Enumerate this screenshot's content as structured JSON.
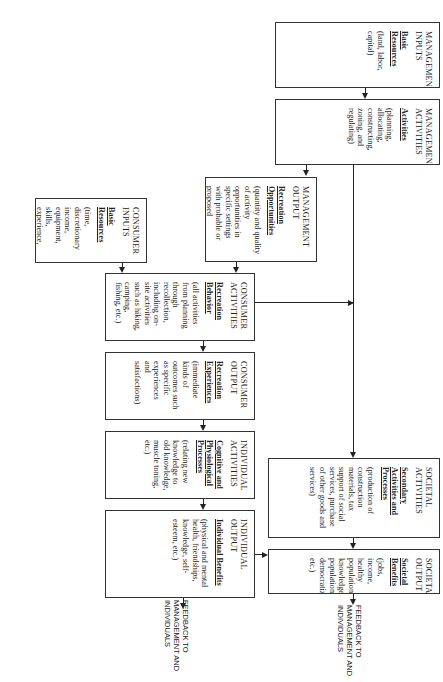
{
  "diagram": {
    "orientation": "rotated 90 degrees clockwise",
    "boxes": {
      "management_inputs": {
        "title": "MANAGEMENT INPUTS",
        "subtitle": "Basic Resources",
        "description": "(land, labor, capital)"
      },
      "management_activities": {
        "title": "MANAGEMENT ACTIVITIES",
        "subtitle": "Activities",
        "description": "(planning, allocating, constructing, zoning, and regulating)"
      },
      "management_output": {
        "title": "MANAGEMENT OUTPUT",
        "subtitle": "Recreation Opportunities",
        "description": "(quantity and quality of activity opportunities in specific settings with probable or proposed experiences and benefits)"
      },
      "consumer_inputs": {
        "title": "CONSUMER INPUTS",
        "subtitle": "Basic Resources",
        "description": "(time, discretionary income, equipment, skills, experience, etc.)"
      },
      "consumer_activities": {
        "title": "CONSUMER ACTIVITIES",
        "subtitle": "Recreation Behavior",
        "description": "(all activities from planning through recollection, including on-site activities such as hiking, camping, fishing, etc.)"
      },
      "consumer_output": {
        "title": "CONSUMER OUTPUT",
        "subtitle": "Recreation Experiences",
        "description": "(immediate kinds of outcomes such as specific experiences and satisfactions)"
      },
      "individual_activities": {
        "title": "INDIVIDUAL ACTIVITIES",
        "subtitle": "Cognitive and Physiological Processes",
        "description": "(relating new knowledge to old knowledge, muscle toning, etc.)"
      },
      "individual_output": {
        "title": "INDIVIDUAL OUTPUT",
        "subtitle": "Individual Benefits",
        "description": "(physical and mental health, friendships, knowledge, self-esteem, etc.)"
      },
      "societal_activities": {
        "title": "SOCIETAL ACTIVITIES",
        "subtitle": "Secondary Activities and Processes",
        "description": "(production of construction materials, tax support of social services, purchase of other goods and services)"
      },
      "societal_output": {
        "title": "SOCIETAL OUTPUT",
        "subtitle": "Societal Benefits",
        "description": "(jobs, income, healthy population, knowledgeable population, democratization, etc.)"
      }
    },
    "feedback": {
      "individual": "FEEDBACK TO MANAGEMENT AND INDIVIDUALS",
      "societal": "FEEDBACK TO MANAGEMENT AND INDIVIDUALS"
    }
  }
}
